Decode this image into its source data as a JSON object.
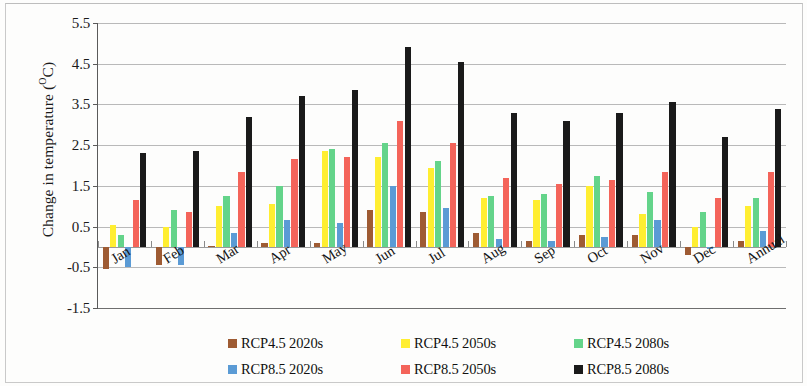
{
  "chart_data": {
    "type": "bar",
    "title": "",
    "xlabel": "",
    "ylabel": "Change in temperature (°C)",
    "ylabel_prefix": "Change in temperature (",
    "ylabel_sup": "O",
    "ylabel_suffix": "C)",
    "ylim": [
      -1.5,
      5.5
    ],
    "ytick_labels": [
      "5.5",
      "4.5",
      "3.5",
      "2.5",
      "1.5",
      "0.5",
      "-0.5",
      "-1.5"
    ],
    "ytick_values": [
      5.5,
      4.5,
      3.5,
      2.5,
      1.5,
      0.5,
      -0.5,
      -1.5
    ],
    "grid": true,
    "legend_position": "bottom",
    "categories": [
      "Jan",
      "Feb",
      "Mar",
      "Apr",
      "May",
      "Jun",
      "Jul",
      "Aug",
      "Sep",
      "Oct",
      "Nov",
      "Dec",
      "Annual"
    ],
    "series": [
      {
        "name": "RCP4.5 2020s",
        "color": "#9e5b33",
        "values": [
          -0.55,
          -0.45,
          0.02,
          0.1,
          0.1,
          0.9,
          0.85,
          0.35,
          0.15,
          0.3,
          0.3,
          -0.2,
          0.15
        ]
      },
      {
        "name": "RCP4.5 2050s",
        "color": "#ffee31",
        "values": [
          0.55,
          0.5,
          1.0,
          1.05,
          2.35,
          2.2,
          1.95,
          1.2,
          1.15,
          1.5,
          0.8,
          0.5,
          1.0
        ]
      },
      {
        "name": "RCP4.5 2080s",
        "color": "#64d48a",
        "values": [
          0.3,
          0.9,
          1.25,
          1.5,
          2.4,
          2.55,
          2.1,
          1.25,
          1.3,
          1.75,
          1.35,
          0.85,
          1.2
        ]
      },
      {
        "name": "RCP8.5 2020s",
        "color": "#5b9bd5",
        "values": [
          -0.5,
          -0.45,
          0.35,
          0.65,
          0.6,
          1.5,
          0.95,
          0.2,
          0.15,
          0.25,
          0.65,
          -0.05,
          0.4
        ]
      },
      {
        "name": "RCP8.5 2050s",
        "color": "#f4645a",
        "values": [
          1.15,
          0.85,
          1.85,
          2.15,
          2.2,
          3.1,
          2.55,
          1.7,
          1.55,
          1.65,
          1.85,
          1.2,
          1.85
        ]
      },
      {
        "name": "RCP8.5 2080s",
        "color": "#1a1a1a",
        "values": [
          2.3,
          2.35,
          3.2,
          3.7,
          3.85,
          4.9,
          4.55,
          3.3,
          3.1,
          3.3,
          3.55,
          2.7,
          3.4
        ]
      }
    ]
  },
  "legend": {
    "rows": [
      [
        "RCP4.5 2020s",
        "RCP4.5 2050s",
        "RCP4.5 2080s"
      ],
      [
        "RCP8.5 2020s",
        "RCP8.5 2050s",
        "RCP8.5 2080s"
      ]
    ]
  }
}
